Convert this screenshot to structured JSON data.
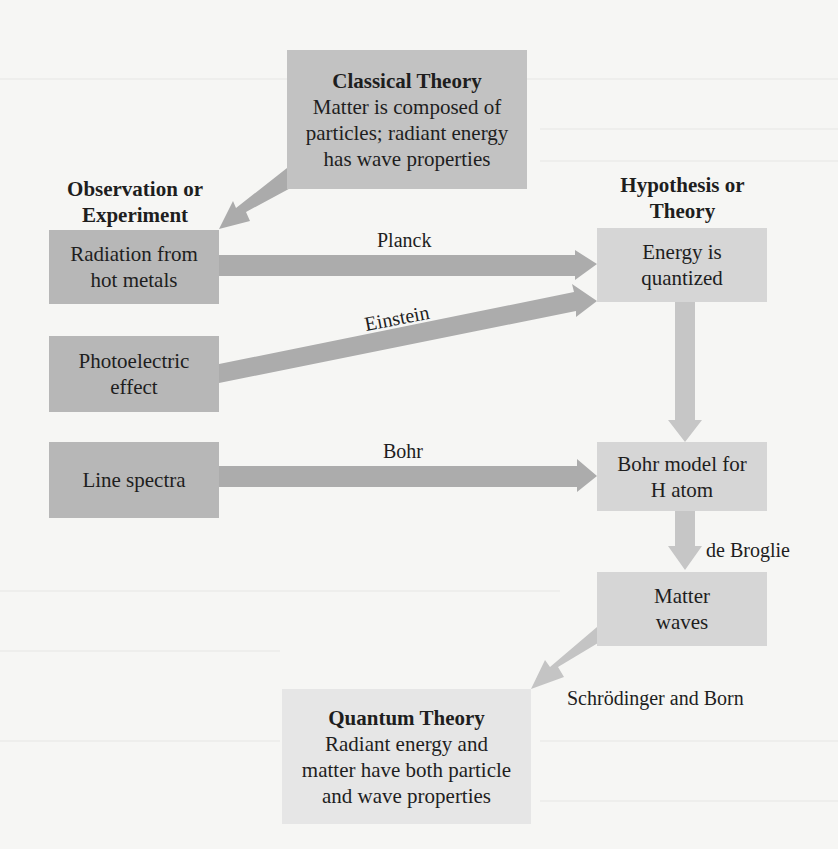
{
  "diagram": {
    "headings": {
      "observation": "Observation or Experiment",
      "observation_line1": "Observation or",
      "observation_line2": "Experiment",
      "hypothesis_line1": "Hypothesis or",
      "hypothesis_line2": "Theory"
    },
    "classical": {
      "title": "Classical Theory",
      "line1": "Matter is composed of",
      "line2": "particles; radiant energy",
      "line3": "has wave properties"
    },
    "observations": [
      {
        "line1": "Radiation from",
        "line2": "hot metals"
      },
      {
        "line1": "Photoelectric",
        "line2": "effect"
      },
      {
        "line1": "Line spectra"
      }
    ],
    "hypotheses": [
      {
        "line1": "Energy is",
        "line2": "quantized"
      },
      {
        "line1": "Bohr model for",
        "line2": "H atom"
      },
      {
        "line1": "Matter",
        "line2": "waves"
      }
    ],
    "quantum": {
      "title": "Quantum Theory",
      "line1": "Radiant energy and",
      "line2": "matter have both particle",
      "line3": "and wave properties"
    },
    "arrow_labels": {
      "planck": "Planck",
      "einstein": "Einstein",
      "bohr": "Bohr",
      "de_broglie": "de Broglie",
      "schrodinger_born": "Schrödinger and Born"
    },
    "colors": {
      "observation_box": "#b7b7b7",
      "classical_box": "#c2c2c2",
      "hypothesis_box": "#d6d6d6",
      "quantum_box": "#e6e6e6",
      "arrow_dark": "#a9a9a9",
      "arrow_light": "#c4c4c4"
    }
  }
}
